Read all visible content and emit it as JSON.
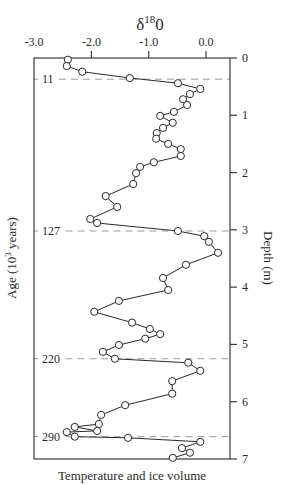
{
  "chart_data": {
    "type": "line",
    "title_main": "δ",
    "title_sup": "18",
    "title_tail": "0",
    "xlabel": "Temperature and ice volume",
    "ylabel_left": "Age (10",
    "ylabel_left_sup": "3",
    "ylabel_left_tail": " years)",
    "ylabel_right": "Depth (m)",
    "x_range": [
      -3.0,
      0.4
    ],
    "y_range": [
      0,
      7
    ],
    "y_inverted": true,
    "x_ticks": [
      {
        "value": -3.0,
        "label": "-3.0"
      },
      {
        "value": -2.0,
        "label": "-2.0"
      },
      {
        "value": -1.0,
        "label": "-1.0"
      },
      {
        "value": 0.0,
        "label": "0.0"
      }
    ],
    "y_ticks_right": [
      {
        "value": 0,
        "label": "0"
      },
      {
        "value": 1,
        "label": "1"
      },
      {
        "value": 2,
        "label": "2"
      },
      {
        "value": 3,
        "label": "3"
      },
      {
        "value": 4,
        "label": "4"
      },
      {
        "value": 5,
        "label": "5"
      },
      {
        "value": 6,
        "label": "6"
      },
      {
        "value": 7,
        "label": "7"
      }
    ],
    "age_markers": [
      {
        "label": "11",
        "depth": 0.37
      },
      {
        "label": "127",
        "depth": 3.02
      },
      {
        "label": "220",
        "depth": 5.25
      },
      {
        "label": "290",
        "depth": 6.61
      }
    ],
    "grid": false,
    "legend": null,
    "series": [
      {
        "name": "δ18O",
        "marker": "open-circle",
        "points": [
          {
            "x": -2.41,
            "depth": 0.03
          },
          {
            "x": -2.43,
            "depth": 0.14
          },
          {
            "x": -2.16,
            "depth": 0.24
          },
          {
            "x": -1.33,
            "depth": 0.35
          },
          {
            "x": -0.49,
            "depth": 0.44
          },
          {
            "x": -0.1,
            "depth": 0.54
          },
          {
            "x": -0.28,
            "depth": 0.63
          },
          {
            "x": -0.4,
            "depth": 0.72
          },
          {
            "x": -0.33,
            "depth": 0.82
          },
          {
            "x": -0.56,
            "depth": 0.94
          },
          {
            "x": -0.8,
            "depth": 1.01
          },
          {
            "x": -0.58,
            "depth": 1.13
          },
          {
            "x": -0.75,
            "depth": 1.22
          },
          {
            "x": -0.86,
            "depth": 1.31
          },
          {
            "x": -0.87,
            "depth": 1.41
          },
          {
            "x": -0.66,
            "depth": 1.5
          },
          {
            "x": -0.44,
            "depth": 1.59
          },
          {
            "x": -0.44,
            "depth": 1.71
          },
          {
            "x": -0.91,
            "depth": 1.82
          },
          {
            "x": -1.15,
            "depth": 1.9
          },
          {
            "x": -1.22,
            "depth": 2.01
          },
          {
            "x": -1.27,
            "depth": 2.2
          },
          {
            "x": -1.75,
            "depth": 2.41
          },
          {
            "x": -1.55,
            "depth": 2.6
          },
          {
            "x": -2.02,
            "depth": 2.81
          },
          {
            "x": -1.9,
            "depth": 2.88
          },
          {
            "x": -0.49,
            "depth": 3.02
          },
          {
            "x": -0.03,
            "depth": 3.11
          },
          {
            "x": 0.05,
            "depth": 3.21
          },
          {
            "x": 0.21,
            "depth": 3.4
          },
          {
            "x": -0.35,
            "depth": 3.61
          },
          {
            "x": -0.75,
            "depth": 3.84
          },
          {
            "x": -0.66,
            "depth": 4.05
          },
          {
            "x": -1.52,
            "depth": 4.24
          },
          {
            "x": -1.95,
            "depth": 4.43
          },
          {
            "x": -1.29,
            "depth": 4.62
          },
          {
            "x": -0.98,
            "depth": 4.73
          },
          {
            "x": -0.8,
            "depth": 4.82
          },
          {
            "x": -1.06,
            "depth": 4.9
          },
          {
            "x": -1.52,
            "depth": 5.01
          },
          {
            "x": -1.8,
            "depth": 5.13
          },
          {
            "x": -1.59,
            "depth": 5.25
          },
          {
            "x": -0.31,
            "depth": 5.32
          },
          {
            "x": -0.1,
            "depth": 5.46
          },
          {
            "x": -0.59,
            "depth": 5.64
          },
          {
            "x": -0.59,
            "depth": 5.86
          },
          {
            "x": -1.41,
            "depth": 6.06
          },
          {
            "x": -1.83,
            "depth": 6.23
          },
          {
            "x": -1.87,
            "depth": 6.39
          },
          {
            "x": -2.29,
            "depth": 6.44
          },
          {
            "x": -1.9,
            "depth": 6.51
          },
          {
            "x": -2.43,
            "depth": 6.53
          },
          {
            "x": -2.29,
            "depth": 6.61
          },
          {
            "x": -1.36,
            "depth": 6.63
          },
          {
            "x": -0.1,
            "depth": 6.7
          },
          {
            "x": -0.42,
            "depth": 6.81
          },
          {
            "x": -0.28,
            "depth": 6.89
          },
          {
            "x": -0.58,
            "depth": 6.98
          }
        ]
      }
    ]
  },
  "style": {
    "axis_color": "#3a3a3a",
    "line_color": "#2a2a2a",
    "dash_color": "#9a9a9a",
    "marker_fill": "#ffffff"
  }
}
